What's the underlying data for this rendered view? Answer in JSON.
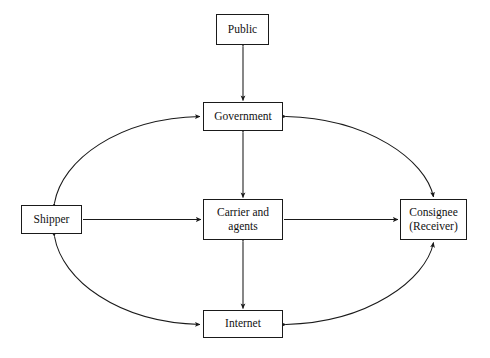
{
  "diagram": {
    "background_color": "#ffffff",
    "line_color": "#1a1a1a",
    "nodes": [
      {
        "id": "public",
        "label": "Public",
        "x": 216,
        "y": 14,
        "w": 53,
        "h": 31
      },
      {
        "id": "government",
        "label": "Government",
        "x": 203,
        "y": 102,
        "w": 80,
        "h": 29
      },
      {
        "id": "carrier",
        "label": "Carrier and\nagents",
        "x": 203,
        "y": 199,
        "w": 80,
        "h": 41
      },
      {
        "id": "internet",
        "label": "Internet",
        "x": 203,
        "y": 310,
        "w": 80,
        "h": 28
      },
      {
        "id": "shipper",
        "label": "Shipper",
        "x": 21,
        "y": 205,
        "w": 61,
        "h": 29
      },
      {
        "id": "consignee",
        "label": "Consignee\n(Receiver)",
        "x": 400,
        "y": 199,
        "w": 67,
        "h": 41
      }
    ],
    "connections": [
      {
        "id": "public-government",
        "from": "Public",
        "to": "Government",
        "style": "straight",
        "arrows": "both"
      },
      {
        "id": "government-carrier",
        "from": "Government",
        "to": "Carrier and agents",
        "style": "straight",
        "arrows": "both"
      },
      {
        "id": "carrier-internet",
        "from": "Carrier and agents",
        "to": "Internet",
        "style": "straight",
        "arrows": "both"
      },
      {
        "id": "shipper-carrier",
        "from": "Shipper",
        "to": "Carrier and agents",
        "style": "straight",
        "arrows": "end"
      },
      {
        "id": "carrier-consignee",
        "from": "Carrier and agents",
        "to": "Consignee (Receiver)",
        "style": "straight",
        "arrows": "end"
      },
      {
        "id": "shipper-government-arc",
        "from": "Shipper",
        "to": "Government",
        "style": "ellipse-arc-upper-left",
        "arrows": "both"
      },
      {
        "id": "government-consignee-arc",
        "from": "Government",
        "to": "Consignee (Receiver)",
        "style": "ellipse-arc-upper-right",
        "arrows": "both"
      },
      {
        "id": "shipper-internet-arc",
        "from": "Shipper",
        "to": "Internet",
        "style": "ellipse-arc-lower-left",
        "arrows": "both"
      },
      {
        "id": "internet-consignee-arc",
        "from": "Internet",
        "to": "Consignee (Receiver)",
        "style": "ellipse-arc-lower-right",
        "arrows": "both"
      }
    ]
  }
}
